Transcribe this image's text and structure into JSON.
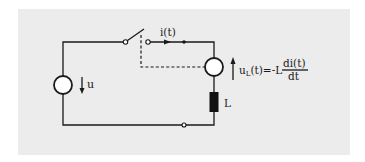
{
  "diagram": {
    "type": "circuit",
    "background_color": "#ececec",
    "line_color": "#1a1a1a",
    "labels": {
      "source_voltage": "u",
      "current": "i(t)",
      "inductor": "L",
      "inductor_voltage_u": "u",
      "inductor_voltage_sub": "L",
      "inductor_voltage_rest": "(t)=-L",
      "derivative_numerator": "di(t)",
      "derivative_denominator": "dt"
    },
    "components": [
      {
        "id": "voltage-source",
        "kind": "source",
        "label": "u"
      },
      {
        "id": "switch",
        "kind": "switch",
        "state": "open",
        "coupled_to": "voltage-meter"
      },
      {
        "id": "voltage-meter",
        "kind": "source",
        "label": "uL(t)=-L di(t)/dt"
      },
      {
        "id": "inductor",
        "kind": "inductor",
        "label": "L"
      }
    ]
  }
}
